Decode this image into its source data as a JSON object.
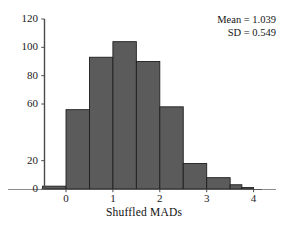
{
  "chart_data": {
    "type": "bar",
    "title": "",
    "subtitle": "",
    "xlabel": "Shuffled MADs",
    "ylabel": "",
    "xlim": [
      -0.78,
      4.62
    ],
    "ylim": [
      0,
      120
    ],
    "grid": false,
    "legend": false,
    "bin_width": 0.5,
    "bin_edges": [
      -0.5,
      0.0,
      0.5,
      1.0,
      1.5,
      2.0,
      2.5,
      3.0,
      3.5
    ],
    "categories": [
      "-0.5–0.0",
      "0.0–0.5",
      "0.5–1.0",
      "1.0–1.5",
      "1.5–2.0",
      "2.0–2.5",
      "2.5–3.0",
      "3.0–3.5"
    ],
    "values": [
      2,
      56,
      93,
      104,
      90,
      58,
      18,
      8
    ],
    "tail_bars": [
      {
        "x0": 3.5,
        "x1": 3.75,
        "value": 3
      },
      {
        "x0": 3.75,
        "x1": 4.0,
        "value": 1
      }
    ],
    "xticks": [
      0,
      1,
      2,
      3,
      4
    ],
    "xtick_labels": [
      "0",
      "1",
      "2",
      "3",
      "4"
    ],
    "yticks": [
      0,
      20,
      60,
      80,
      100,
      120
    ],
    "ytick_labels": [
      "0",
      "20",
      "60",
      "80",
      "100",
      "120"
    ],
    "bar_color": "#5b5b5b",
    "bar_edge_color": "#1f1f1f",
    "axis_color": "#4a4a4a",
    "text_color": "#151515",
    "background_color": "#ffffff"
  },
  "annotations": {
    "mean_label": "Mean = 1.039",
    "sd_label": "SD = 0.549"
  },
  "axis": {
    "x_title": "Shuffled MADs"
  }
}
